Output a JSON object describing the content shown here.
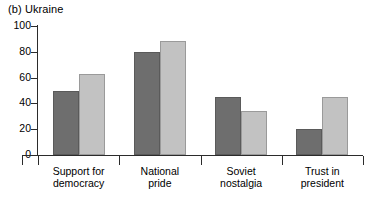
{
  "chart_data": {
    "type": "bar",
    "title": "(b) Ukraine",
    "xlabel": "",
    "ylabel": "",
    "ylim": [
      0,
      100
    ],
    "yticks": [
      0,
      20,
      40,
      60,
      80,
      100
    ],
    "grid": false,
    "legend": "none",
    "categories": [
      "Support for democracy",
      "National pride",
      "Soviet nostalgia",
      "Trust in president"
    ],
    "category_lines": [
      [
        "Support for",
        "democracy"
      ],
      [
        "National",
        "pride"
      ],
      [
        "Soviet",
        "nostalgia"
      ],
      [
        "Trust in",
        "president"
      ]
    ],
    "series": [
      {
        "name": "series-1",
        "color": "#6e6e6e",
        "values": [
          50,
          80,
          45,
          20
        ]
      },
      {
        "name": "series-2",
        "color": "#c2c2c2",
        "values": [
          63,
          88,
          34,
          45
        ]
      }
    ]
  },
  "axis": {
    "y_tick_labels": [
      "100",
      "80",
      "60",
      "40",
      "20",
      "0"
    ]
  }
}
